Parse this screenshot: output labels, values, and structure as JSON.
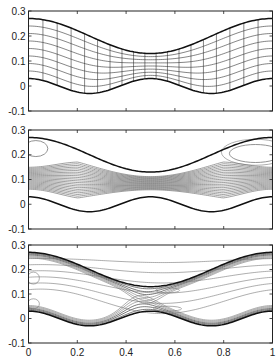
{
  "chart_data": [
    {
      "type": "line",
      "title": "",
      "description": "Computational mesh between wavy walls",
      "xlim": [
        0,
        1
      ],
      "ylim": [
        -0.1,
        0.3
      ],
      "yticks": [
        "0.3",
        "0.2",
        "0.1",
        "0",
        "-0.1"
      ],
      "xticks_visible": false,
      "upper_wall": {
        "formula": "0.2 + 0.07*cos(2*pi*x)",
        "x": [
          0,
          0.25,
          0.5,
          0.75,
          1
        ],
        "y": [
          0.27,
          0.2,
          0.13,
          0.2,
          0.27
        ]
      },
      "lower_wall": {
        "formula": "0.03*cos(4*pi*x)",
        "x": [
          0,
          0.25,
          0.5,
          0.75,
          1
        ],
        "y": [
          0.03,
          -0.03,
          0.03,
          -0.03,
          0.03
        ]
      },
      "mesh": {
        "streamwise_lines": 19,
        "cross_lines": 8
      }
    },
    {
      "type": "line",
      "title": "",
      "description": "Streamline contours in wavy channel",
      "xlim": [
        0,
        1
      ],
      "ylim": [
        -0.1,
        0.3
      ],
      "yticks": [
        "0.3",
        "0.2",
        "0.1",
        "0",
        "-0.1"
      ],
      "xticks_visible": false,
      "contour_levels": 22,
      "annotations": [
        "closed recirculation loop near upper-left wall",
        "closed recirculation loop near upper-right wall"
      ]
    },
    {
      "type": "line",
      "title": "",
      "description": "Vorticity contours in wavy channel",
      "xlim": [
        0,
        1
      ],
      "ylim": [
        -0.1,
        0.3
      ],
      "xticks": [
        "0",
        "0.2",
        "0.4",
        "0.6",
        "0.8",
        "1"
      ],
      "yticks": [
        "0.3",
        "0.2",
        "0.1",
        "0",
        "-0.1"
      ],
      "contour_levels": 12
    }
  ],
  "panels": [
    {
      "top": 11,
      "bottom": 111
    },
    {
      "top": 130,
      "bottom": 229
    },
    {
      "top": 245,
      "bottom": 343
    }
  ],
  "axes": {
    "left": 28.5,
    "right": 272.5
  },
  "colors": {
    "wall": "#111111",
    "mesh": "#333333",
    "contour": "#777777",
    "contour_dark": "#222222",
    "axis": "#222222"
  }
}
